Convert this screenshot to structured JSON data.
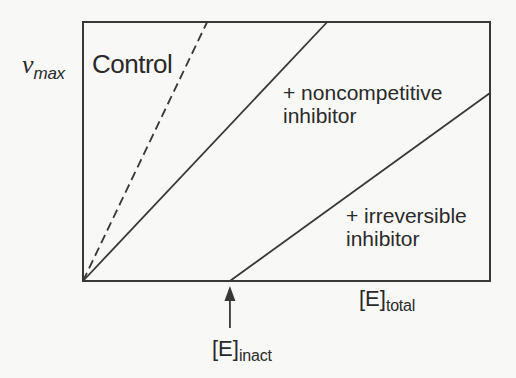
{
  "figure": {
    "background": "#f8f8f6",
    "line_color": "#383838",
    "text_color": "#2a2a2a",
    "y_axis_label": {
      "symbol": "ν",
      "subscript": "max"
    },
    "x_axis_label": {
      "symbol": "[E]",
      "subscript": "total"
    },
    "inact_label": {
      "symbol": "[E]",
      "subscript": "inact"
    },
    "labels": {
      "control": "Control",
      "noncompetitive_lines": [
        "+ noncompetitive",
        "inhibitor"
      ],
      "irreversible_lines": [
        "+ irreversible",
        "inhibitor"
      ]
    }
  },
  "chart_data": {
    "type": "line",
    "title": "",
    "xlabel": "[E]total",
    "ylabel": "vmax",
    "axes_numeric": false,
    "grid": false,
    "legend_position": "none",
    "xlim": [
      0,
      1
    ],
    "ylim": [
      0,
      1
    ],
    "series": [
      {
        "id": "control",
        "name": "Control",
        "style": "dashed",
        "points": [
          [
            0,
            0
          ],
          [
            0.305,
            1.0
          ]
        ]
      },
      {
        "id": "noncompetitive-inhibitor",
        "name": "+ noncompetitive inhibitor",
        "style": "solid",
        "points": [
          [
            0,
            0
          ],
          [
            0.6,
            1.0
          ]
        ]
      },
      {
        "id": "irreversible-inhibitor",
        "name": "+ irreversible inhibitor",
        "style": "solid",
        "points": [
          [
            0.361,
            0
          ],
          [
            1.0,
            0.726
          ]
        ]
      }
    ],
    "annotations": [
      {
        "id": "inact-marker",
        "text": "[E]inact",
        "x": 0.361,
        "y": 0,
        "marker": "up-arrow"
      }
    ]
  }
}
